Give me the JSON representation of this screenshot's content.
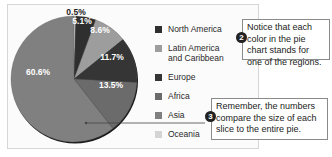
{
  "chart_data": {
    "type": "pie",
    "title": "",
    "slices": [
      {
        "label": "Oceania",
        "value": 0.5,
        "display": "0.5%",
        "color": "#d4d4d4"
      },
      {
        "label": "North America",
        "value": 5.1,
        "display": "5.1%",
        "color": "#2f2f2f"
      },
      {
        "label": "Latin America and Caribbean",
        "value": 8.6,
        "display": "8.6%",
        "color": "#9d9d9d"
      },
      {
        "label": "Europe",
        "value": 11.7,
        "display": "11.7%",
        "color": "#353535"
      },
      {
        "label": "Africa",
        "value": 13.5,
        "display": "13.5%",
        "color": "#6b6b6b"
      },
      {
        "label": "Asia",
        "value": 60.6,
        "display": "60.6%",
        "color": "#808080"
      }
    ],
    "legend_position": "right",
    "legend_order": [
      "North America",
      "Latin America and Caribbean",
      "Europe",
      "Africa",
      "Asia",
      "Oceania"
    ]
  },
  "legend": {
    "items": [
      {
        "line1": "North America",
        "line2": "",
        "color": "#2f2f2f"
      },
      {
        "line1": "Latin America",
        "line2": "and Caribbean",
        "color": "#9d9d9d"
      },
      {
        "line1": "Europe",
        "line2": "",
        "color": "#353535"
      },
      {
        "line1": "Africa",
        "line2": "",
        "color": "#6b6b6b"
      },
      {
        "line1": "Asia",
        "line2": "",
        "color": "#808080"
      },
      {
        "line1": "Oceania",
        "line2": "",
        "color": "#d4d4d4"
      }
    ]
  },
  "callouts": [
    {
      "number": "2",
      "text": "Notice that each color in the pie chart stands for one of the regions."
    },
    {
      "number": "3",
      "text": "Remember, the numbers compare the size of each slice to the entire pie."
    }
  ]
}
